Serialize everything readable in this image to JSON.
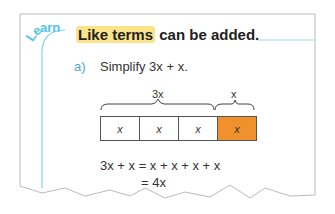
{
  "badge": {
    "label": "Learn"
  },
  "heading": {
    "highlight": "Like terms",
    "rest": " can be added."
  },
  "question": {
    "label": "a)",
    "text": "Simplify 3x + x."
  },
  "diagram": {
    "group_labels": [
      "3x",
      "x"
    ],
    "cells": [
      "x",
      "x",
      "x",
      "x"
    ],
    "highlight_color": "#f0912d"
  },
  "working": {
    "line1": "3x + x = x + x + x + x",
    "line2": "= 4x"
  },
  "colors": {
    "accent": "#4fc3e8",
    "highlight": "#fbe38a"
  }
}
